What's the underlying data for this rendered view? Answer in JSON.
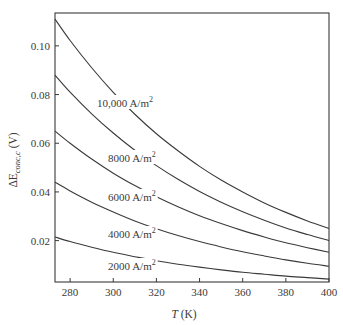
{
  "chart_data": {
    "type": "line",
    "title": "",
    "xlabel": "T (K)",
    "xlabel_italic": "T",
    "xlabel_unit": " (K)",
    "ylabel": "ΔE_conc,c (V)",
    "ylabel_main": "ΔE",
    "ylabel_sub": "conc,c",
    "ylabel_unit": " (V)",
    "xlim": [
      273,
      400
    ],
    "ylim": [
      0.003,
      0.1135
    ],
    "x_ticks": [
      280,
      300,
      320,
      340,
      360,
      380,
      400
    ],
    "y_ticks": [
      0.02,
      0.04,
      0.06,
      0.08,
      0.1
    ],
    "y_tick_labels": [
      "0.02",
      "0.04",
      "0.06",
      "0.08",
      "0.10"
    ],
    "grid": false,
    "legend": "inline labels",
    "x": [
      273,
      280,
      290,
      300,
      310,
      320,
      330,
      340,
      350,
      360,
      370,
      380,
      390,
      400
    ],
    "series": [
      {
        "name": "10,000 A/m²",
        "label_main": "10,000 A/m",
        "label_sup": "2",
        "label_pos": [
          97,
          107
        ],
        "values": [
          0.111,
          0.1022,
          0.091,
          0.0809,
          0.0719,
          0.0639,
          0.0569,
          0.0505,
          0.0449,
          0.04,
          0.0355,
          0.0316,
          0.0281,
          0.025
        ]
      },
      {
        "name": "8000 A/m²",
        "label_main": "8000 A/m",
        "label_sup": "2",
        "label_pos": [
          108,
          162
        ],
        "values": [
          0.088,
          0.081,
          0.0721,
          0.0642,
          0.0571,
          0.0508,
          0.0452,
          0.0402,
          0.0358,
          0.0319,
          0.0284,
          0.0252,
          0.0225,
          0.02
        ]
      },
      {
        "name": "6000 A/m²",
        "label_main": "6000 A/m",
        "label_sup": "2",
        "label_pos": [
          108,
          201
        ],
        "values": [
          0.065,
          0.06,
          0.0535,
          0.0477,
          0.0426,
          0.038,
          0.0339,
          0.0302,
          0.027,
          0.0241,
          0.0215,
          0.0191,
          0.0171,
          0.0152
        ]
      },
      {
        "name": "4000 A/m²",
        "label_main": "4000 A/m",
        "label_sup": "2",
        "label_pos": [
          108,
          238
        ],
        "values": [
          0.044,
          0.0404,
          0.0358,
          0.0318,
          0.0281,
          0.0249,
          0.0221,
          0.0196,
          0.0174,
          0.0154,
          0.0137,
          0.0121,
          0.0107,
          0.0095
        ]
      },
      {
        "name": "2000 A/m²",
        "label_main": "2000 A/m",
        "label_sup": "2",
        "label_pos": [
          108,
          270
        ],
        "values": [
          0.0215,
          0.0196,
          0.0173,
          0.0152,
          0.0134,
          0.0117,
          0.0103,
          0.0091,
          0.008,
          0.007,
          0.0062,
          0.0054,
          0.0048,
          0.0042
        ]
      }
    ]
  },
  "colors": {
    "line": "#3a3a3a",
    "background": "#ffffff"
  }
}
